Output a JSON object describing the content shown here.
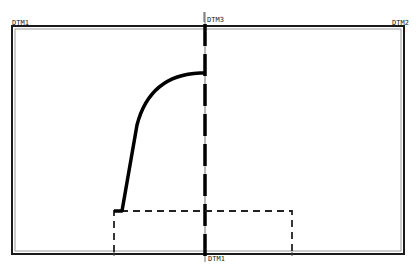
{
  "diagram": {
    "type": "cad-sketch",
    "datums": {
      "left_top": "DTM1",
      "right_top": "DTM2",
      "center_top": "DTM3",
      "center_bottom": "DTM1"
    },
    "colors": {
      "background": "#ffffff",
      "frame": "#1a1a1a",
      "frame_inner": "#9a9a9a",
      "centerline": "#8a8a8a",
      "geometry": "#000000",
      "dashed": "#222222"
    },
    "frame": {
      "x": 12,
      "y": 26,
      "width": 392,
      "height": 228
    },
    "centerline_x": 205,
    "profile": {
      "start": [
        122,
        211
      ],
      "line_to": [
        137,
        125
      ],
      "arc_to": [
        200,
        73
      ],
      "end": [
        205,
        73
      ]
    },
    "dashed_rect": {
      "x": 114,
      "y": 211,
      "width": 178,
      "height": 43
    }
  }
}
